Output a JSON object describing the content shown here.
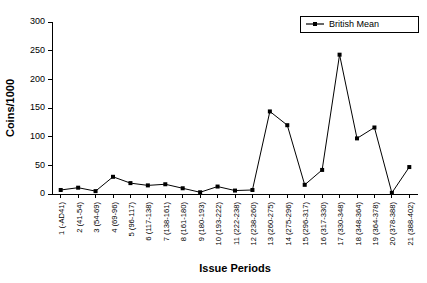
{
  "chart_data": {
    "type": "line",
    "title": "",
    "xlabel": "Issue Periods",
    "ylabel": "Coins/1000",
    "ylim": [
      0,
      300
    ],
    "yticks": [
      0,
      50,
      100,
      150,
      200,
      250,
      300
    ],
    "grid": false,
    "legend_position": "top-right",
    "categories": [
      "1 (-AD41)",
      "2 (41-54)",
      "3 (54-69)",
      "4 (69-96)",
      "5 (96-117)",
      "6 (117-138)",
      "7 (138-161)",
      "8 (161-180)",
      "9 (180-193)",
      "10 (193-222)",
      "11 (222-238)",
      "12 (238-260)",
      "13 (260-275)",
      "14 (275-296)",
      "15 (296-317)",
      "16 (317-330)",
      "17 (330-348)",
      "18 (348-364)",
      "19 (364-378)",
      "20 (378-388)",
      "21 (388-402)"
    ],
    "series": [
      {
        "name": "British Mean",
        "color": "#000000",
        "marker": "square",
        "values": [
          7,
          11,
          5,
          30,
          19,
          15,
          17,
          10,
          3,
          13,
          6,
          7,
          144,
          120,
          16,
          42,
          243,
          97,
          116,
          2,
          47
        ]
      }
    ]
  },
  "legend": {
    "entries": [
      {
        "label": "British Mean"
      }
    ]
  },
  "axes": {
    "y_title": "Coins/1000",
    "x_title": "Issue Periods"
  }
}
